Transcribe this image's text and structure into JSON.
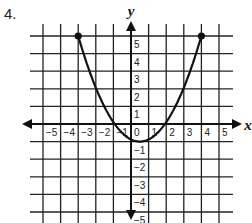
{
  "problem": {
    "number": "4."
  },
  "chart_data": {
    "type": "line",
    "title": "",
    "xlabel": "x",
    "ylabel": "y",
    "xlim": [
      -5,
      5
    ],
    "ylim": [
      -5,
      5
    ],
    "grid": true,
    "x_ticks": [
      "-5",
      "-4",
      "-3",
      "-2",
      "-1",
      "0",
      "1",
      "2",
      "3",
      "4",
      "5"
    ],
    "y_ticks": [
      "5",
      "4",
      "3",
      "2",
      "1",
      "-1",
      "-2",
      "-3",
      "-4",
      "-5"
    ],
    "series": [
      {
        "name": "parabola",
        "description": "Upward-opening parabola with vertex (0.5, -1) and closed endpoints",
        "equation_estimate": "y = 0.5(x - 0.5)^2 - 1",
        "vertex": [
          0.5,
          -1
        ],
        "x_intercepts": [
          -0.9,
          1.9
        ],
        "y_intercept": -0.9,
        "endpoints": [
          [
            -3,
            5
          ],
          [
            4,
            5
          ]
        ],
        "endpoint_style": "closed-dot",
        "x": [
          -3,
          -2,
          -1,
          0,
          0.5,
          1,
          2,
          3,
          4
        ],
        "values": [
          5.1,
          2.1,
          0.1,
          -0.9,
          -1,
          -0.9,
          0.1,
          2.1,
          5.1
        ]
      }
    ]
  }
}
